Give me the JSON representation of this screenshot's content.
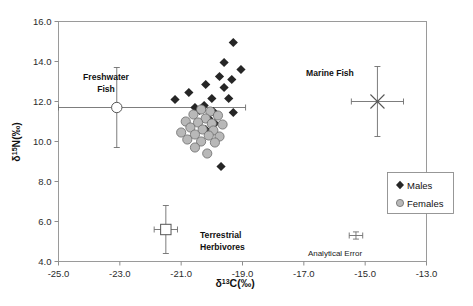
{
  "chart_data": {
    "type": "scatter",
    "title": "",
    "xlabel": "δ¹³C(‰)",
    "ylabel": "δ¹⁵N(‰)",
    "xlabel_parts": {
      "pre": "δ",
      "sup": "13",
      "post": "C(‰)"
    },
    "ylabel_parts": {
      "pre": "δ",
      "sup": "15",
      "post": "N(‰)"
    },
    "xlim": [
      -25.0,
      -13.0
    ],
    "ylim": [
      4.0,
      16.0
    ],
    "xticks": [
      -25.0,
      -23.0,
      -21.0,
      -19.0,
      -17.0,
      -15.0,
      -13.0
    ],
    "xtick_labels": [
      "-25.0",
      "-23.0",
      "-21.0",
      "-19.0",
      "-17.0",
      "-15.0",
      "-13.0"
    ],
    "yticks": [
      4.0,
      6.0,
      8.0,
      10.0,
      12.0,
      14.0,
      16.0
    ],
    "ytick_labels": [
      "4.0",
      "6.0",
      "8.0",
      "10.0",
      "12.0",
      "14.0",
      "16.0"
    ],
    "grid": false,
    "legend_position": "bottom-right-inside",
    "series": [
      {
        "name": "Males",
        "marker": "filled-diamond",
        "color": "#262626",
        "points": [
          [
            -19.3,
            14.95
          ],
          [
            -19.6,
            13.95
          ],
          [
            -19.05,
            13.6
          ],
          [
            -19.75,
            13.25
          ],
          [
            -19.35,
            13.1
          ],
          [
            -20.2,
            12.85
          ],
          [
            -19.6,
            12.7
          ],
          [
            -20.75,
            12.45
          ],
          [
            -21.2,
            12.1
          ],
          [
            -20.0,
            12.15
          ],
          [
            -19.45,
            12.15
          ],
          [
            -20.25,
            11.8
          ],
          [
            -20.55,
            11.7
          ],
          [
            -20.4,
            11.55
          ],
          [
            -19.95,
            11.5
          ],
          [
            -19.3,
            11.45
          ],
          [
            -20.1,
            11.15
          ],
          [
            -19.9,
            10.9
          ],
          [
            -20.2,
            10.6
          ],
          [
            -19.7,
            8.75
          ]
        ]
      },
      {
        "name": "Females",
        "marker": "filled-circle-grey",
        "color": "#b8b8b8",
        "points": [
          [
            -20.35,
            11.6
          ],
          [
            -20.05,
            11.5
          ],
          [
            -20.6,
            11.35
          ],
          [
            -19.8,
            11.3
          ],
          [
            -20.2,
            11.15
          ],
          [
            -20.85,
            11.0
          ],
          [
            -20.45,
            10.95
          ],
          [
            -20.0,
            10.9
          ],
          [
            -19.65,
            10.85
          ],
          [
            -20.7,
            10.7
          ],
          [
            -20.3,
            10.6
          ],
          [
            -19.95,
            10.55
          ],
          [
            -21.0,
            10.45
          ],
          [
            -20.55,
            10.35
          ],
          [
            -20.1,
            10.3
          ],
          [
            -19.75,
            10.25
          ],
          [
            -20.8,
            10.1
          ],
          [
            -20.35,
            10.0
          ],
          [
            -19.9,
            9.95
          ],
          [
            -20.55,
            9.7
          ],
          [
            -20.15,
            9.4
          ]
        ]
      }
    ],
    "annotations": [
      {
        "name": "freshwater-fish",
        "label": "Freshwater\nFish",
        "label_line1": "Freshwater",
        "label_line2": "Fish",
        "marker": "open-circle",
        "x": -23.1,
        "y": 11.7,
        "yerr": 2.0,
        "x_err_low": -25.0,
        "x_err_high": -18.9
      },
      {
        "name": "marine-fish",
        "label": "Marine Fish",
        "marker": "cross-x",
        "x": -14.6,
        "y": 12.0,
        "yerr": 1.75,
        "xerr": 0.85
      },
      {
        "name": "terrestrial-herbivores",
        "label": "Terrestrial\nHerbivores",
        "label_line1": "Terrestrial",
        "label_line2": "Herbivores",
        "marker": "open-square",
        "x": -21.5,
        "y": 5.6,
        "yerr": 1.2,
        "xerr": 0.38
      },
      {
        "name": "analytical-error",
        "label": "Analytical Error",
        "marker": "small-cross",
        "x": -15.3,
        "y": 5.3,
        "yerr": 0.18,
        "xerr": 0.22
      }
    ],
    "legend": [
      {
        "label": "Males",
        "marker": "filled-diamond"
      },
      {
        "label": "Females",
        "marker": "open-circle-grey"
      }
    ]
  }
}
